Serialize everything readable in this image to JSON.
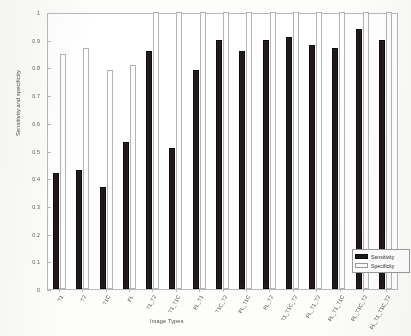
{
  "chart_data": {
    "type": "bar",
    "title": "",
    "xlabel": "Image Types",
    "ylabel": "Sensitivity and specificity",
    "ylim": [
      0,
      1
    ],
    "yticks": [
      "0",
      "0.1",
      "0.2",
      "0.3",
      "0.4",
      "0.5",
      "0.6",
      "0.7",
      "0.8",
      "0.9",
      "1"
    ],
    "ytick_values": [
      0,
      0.1,
      0.2,
      0.3,
      0.4,
      0.5,
      0.6,
      0.7,
      0.8,
      0.9,
      1
    ],
    "grid": false,
    "legend_position": "bottom-right",
    "categories": [
      "T1",
      "T2",
      "T1C",
      "FL",
      "T1_T2",
      "T1_T1C",
      "FL_T1",
      "T1C_T2",
      "FL_T1C",
      "FL_T2",
      "T1_T1C_T2",
      "FL_T1_T2",
      "FL_T1_T1C",
      "FL_T1C_T2",
      "FL_T1_T1C_T2"
    ],
    "series": [
      {
        "name": "Sensitivity",
        "color": "#1d1715",
        "values": [
          0.42,
          0.43,
          0.37,
          0.53,
          0.86,
          0.51,
          0.79,
          0.9,
          0.86,
          0.9,
          0.91,
          0.88,
          0.87,
          0.94,
          0.9
        ]
      },
      {
        "name": "Specificity",
        "color": "#ffffff",
        "values": [
          0.85,
          0.87,
          0.79,
          0.81,
          1.0,
          1.0,
          1.0,
          1.0,
          1.0,
          1.0,
          1.0,
          1.0,
          1.0,
          1.0,
          1.0
        ]
      }
    ]
  },
  "legend": {
    "items": [
      {
        "label": "Sensitivity"
      },
      {
        "label": "Specificity"
      }
    ]
  }
}
